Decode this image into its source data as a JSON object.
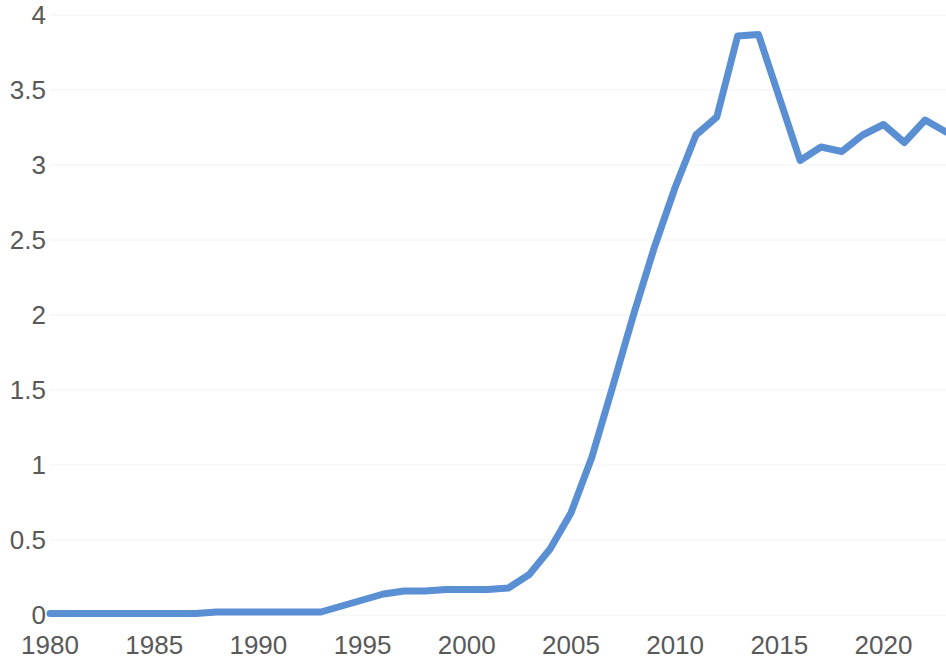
{
  "chart_data": {
    "type": "line",
    "title": "",
    "subtitle": "",
    "xlabel": "",
    "ylabel": "",
    "xlim": [
      1980,
      2023
    ],
    "ylim": [
      0,
      4
    ],
    "grid": true,
    "legend": false,
    "legend_position": "none",
    "x_tick_labels": [
      "1980",
      "1985",
      "1990",
      "1995",
      "2000",
      "2005",
      "2010",
      "2015",
      "2020"
    ],
    "x_ticks": [
      1980,
      1985,
      1990,
      1995,
      2000,
      2005,
      2010,
      2015,
      2020
    ],
    "y_tick_labels": [
      "0",
      "0.5",
      "1",
      "1.5",
      "2",
      "2.5",
      "3",
      "3.5",
      "4"
    ],
    "y_ticks": [
      0,
      0.5,
      1,
      1.5,
      2,
      2.5,
      3,
      3.5,
      4
    ],
    "series": [
      {
        "name": "series-1",
        "color": "#5B8FD4",
        "x": [
          1980,
          1981,
          1982,
          1983,
          1984,
          1985,
          1986,
          1987,
          1988,
          1989,
          1990,
          1991,
          1992,
          1993,
          1994,
          1995,
          1996,
          1997,
          1998,
          1999,
          2000,
          2001,
          2002,
          2003,
          2004,
          2005,
          2006,
          2007,
          2008,
          2009,
          2010,
          2011,
          2012,
          2013,
          2014,
          2015,
          2016,
          2017,
          2018,
          2019,
          2020,
          2021,
          2022,
          2023
        ],
        "values": [
          0.01,
          0.01,
          0.01,
          0.01,
          0.01,
          0.01,
          0.01,
          0.01,
          0.02,
          0.02,
          0.02,
          0.02,
          0.02,
          0.02,
          0.06,
          0.1,
          0.14,
          0.16,
          0.16,
          0.17,
          0.17,
          0.17,
          0.18,
          0.27,
          0.44,
          0.68,
          1.05,
          1.52,
          2.0,
          2.45,
          2.85,
          3.2,
          3.32,
          3.86,
          3.87,
          3.45,
          3.03,
          3.12,
          3.09,
          3.2,
          3.27,
          3.15,
          3.3,
          3.22
        ]
      }
    ],
    "grid_color": "#f2f2f2",
    "tick_label_color": "#595959",
    "background_color": "#ffffff"
  },
  "axes": {
    "plot_left": 50,
    "plot_right": 946,
    "plot_top": 15,
    "plot_bottom": 615
  }
}
